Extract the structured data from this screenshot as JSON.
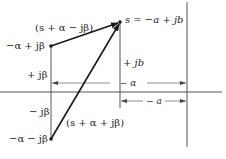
{
  "diagram": {
    "type": "s-plane pole vector diagram",
    "labels": {
      "vector_upper": "(s + α − jβ)",
      "vector_lower": "(s + α + jβ)",
      "point_upper_pole": "−α + jβ",
      "point_lower_pole": "−α − jβ",
      "point_s": "s = −a + jb",
      "upper_height": "+ jβ",
      "lower_height": "− jβ",
      "s_height": "+ jb",
      "dim_alpha": "− α",
      "dim_a": "− a"
    },
    "colors": {
      "ink": "#1a1a1a",
      "axis": "#555555",
      "background": "#ffffff"
    },
    "points": {
      "upper_pole": {
        "x": 51,
        "y": 46
      },
      "lower_pole": {
        "x": 51,
        "y": 139
      },
      "s": {
        "x": 120,
        "y": 22
      }
    },
    "axes": {
      "real_axis_y": 92,
      "imag_axis_x": 187
    }
  }
}
